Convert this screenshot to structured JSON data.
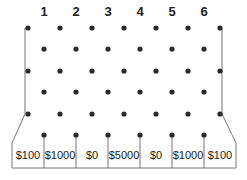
{
  "columns": [
    {
      "label": "1",
      "x": 44
    },
    {
      "label": "2",
      "x": 76
    },
    {
      "label": "3",
      "x": 108
    },
    {
      "label": "4",
      "x": 140
    },
    {
      "label": "5",
      "x": 172
    },
    {
      "label": "6",
      "x": 204
    }
  ],
  "slots": [
    {
      "label": "$100",
      "x": 28
    },
    {
      "label": "$1000",
      "x": 60
    },
    {
      "label": "$0",
      "x": 92
    },
    {
      "label": "$5000",
      "x": 124
    },
    {
      "label": "$0",
      "x": 156
    },
    {
      "label": "$1000",
      "x": 188
    },
    {
      "label": "$100",
      "x": 220
    }
  ],
  "peg_rows": {
    "wide_row_x": [
      28,
      60,
      92,
      124,
      156,
      188,
      220
    ],
    "narrow_row_x": [
      44,
      76,
      108,
      140,
      172,
      204
    ],
    "wide_row_y": [
      28,
      71,
      114
    ],
    "narrow_row_y": [
      49,
      92,
      135
    ]
  },
  "colors": {
    "peg": "#2b2b2b",
    "wall": "#777777",
    "text": "#222222"
  }
}
